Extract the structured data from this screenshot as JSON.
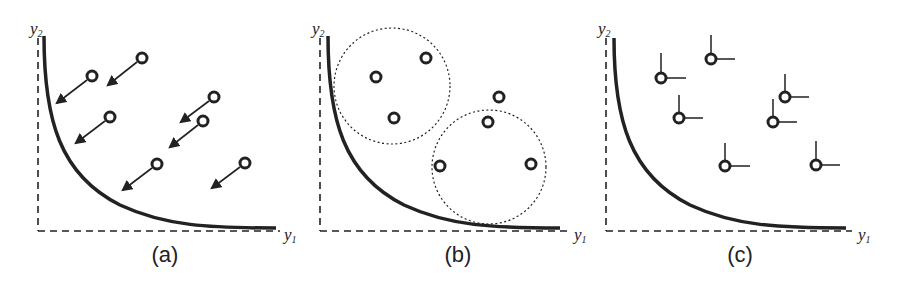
{
  "panels": [
    {
      "id": "a",
      "label": "(a)",
      "x_axis_label": "y",
      "x_axis_sub": "1",
      "y_axis_label": "y",
      "y_axis_sub": "2",
      "description": "Points with arrows pointing toward the Pareto front (convergence)"
    },
    {
      "id": "b",
      "label": "(b)",
      "x_axis_label": "y",
      "x_axis_sub": "1",
      "y_axis_label": "y",
      "y_axis_sub": "2",
      "description": "Points grouped in dotted circles (diversity / niching)"
    },
    {
      "id": "c",
      "label": "(c)",
      "x_axis_label": "y",
      "x_axis_sub": "1",
      "y_axis_label": "y",
      "y_axis_sub": "2",
      "description": "Points with dominance corner lines (Pareto dominance)"
    }
  ],
  "colors": {
    "ink": "#222222",
    "background": "#ffffff"
  }
}
